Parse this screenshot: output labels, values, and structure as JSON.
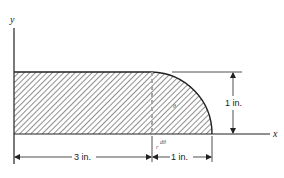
{
  "diagram": {
    "type": "engineering-figure",
    "axes": {
      "x_label": "x",
      "y_label": "y"
    },
    "dimensions": {
      "rect_length": "3 in.",
      "quarter_radius": "1 in.",
      "height": "1 in."
    },
    "annotations": {
      "theta": "θ",
      "radius": "r",
      "dtheta": "dθ"
    },
    "colors": {
      "line": "#222222",
      "hatch": "#333333",
      "background": "#ffffff"
    }
  }
}
